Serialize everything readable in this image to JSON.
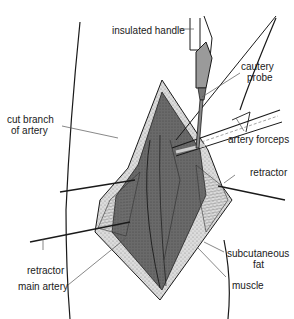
{
  "diagram": {
    "labels": {
      "insulated_handle": "insulated handle",
      "cautery_probe_1": "cautery",
      "cautery_probe_2": "probe",
      "cut_branch_1": "cut branch",
      "cut_branch_2": "of artery",
      "artery_forceps": "artery forceps",
      "retractor_right": "retractor",
      "retractor_left": "retractor",
      "main_artery": "main artery",
      "subcutaneous_1": "subcutaneous",
      "subcutaneous_2": "fat",
      "muscle": "muscle"
    },
    "colors": {
      "line": "#1a1a1a",
      "tissue_dark": "#5a5a5a",
      "tissue_mid": "#8a8a8a",
      "fat": "#d8d8d8",
      "probe": "#9a9a9a",
      "leader": "#555555"
    }
  }
}
